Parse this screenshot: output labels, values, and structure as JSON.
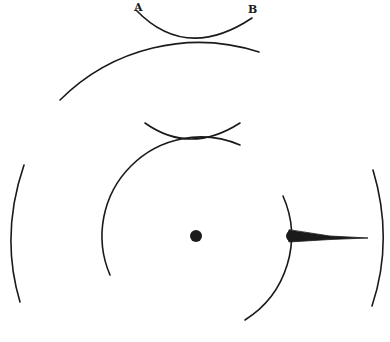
{
  "figure": {
    "labels": {
      "a": "A",
      "b": "B"
    },
    "colors": {
      "ink": "#1a1a1a",
      "background": "#ffffff"
    },
    "elements": [
      "upper-arc-AB",
      "outer-large-arc",
      "inner-top-arc",
      "middle-circle-arc",
      "middle-circle-right-arc",
      "left-outer-arc",
      "right-outer-arc",
      "center-dot",
      "tapered-spike"
    ]
  }
}
